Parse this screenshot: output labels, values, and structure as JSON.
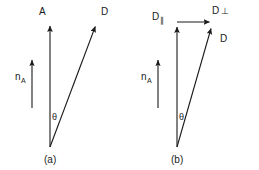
{
  "figure": {
    "background_color": "#ffffff",
    "stroke_color": "#1a1a1a",
    "panels": [
      {
        "id": "a",
        "caption": "(a)",
        "vectors": [
          {
            "name": "A",
            "label": "A",
            "label_symbol": "A",
            "from": [
              50,
              147
            ],
            "to": [
              50,
              22
            ],
            "arrowhead": true
          },
          {
            "name": "D",
            "label": "D",
            "label_symbol": "D",
            "from": [
              50,
              147
            ],
            "to": [
              97,
              22
            ],
            "arrowhead": true
          },
          {
            "name": "n_A",
            "label_symbol": "n",
            "label_subscript": "A",
            "from": [
              32,
              108
            ],
            "to": [
              32,
              56
            ],
            "arrowhead": true
          }
        ],
        "angle": {
          "name": "theta",
          "symbol": "θ",
          "between": [
            "A",
            "D"
          ]
        }
      },
      {
        "id": "b",
        "caption": "(b)",
        "vectors": [
          {
            "name": "D_parallel",
            "label_symbol": "D",
            "label_subscript": "∥",
            "from": [
              177,
              147
            ],
            "to": [
              177,
              24
            ],
            "arrowhead": true
          },
          {
            "name": "D_perpendicular",
            "label_symbol": "D",
            "label_subscript": "⊥",
            "from": [
              177,
              22
            ],
            "to": [
              212,
              22
            ],
            "arrowhead": true
          },
          {
            "name": "D",
            "label_symbol": "D",
            "from": [
              177,
              147
            ],
            "to": [
              213,
              25
            ],
            "arrowhead": true
          },
          {
            "name": "n_A",
            "label_symbol": "n",
            "label_subscript": "A",
            "from": [
              158,
              108
            ],
            "to": [
              158,
              56
            ],
            "arrowhead": true
          }
        ],
        "angle": {
          "name": "theta",
          "symbol": "θ",
          "between": [
            "D_parallel",
            "D"
          ]
        }
      }
    ]
  },
  "labels": {
    "panel_a": {
      "A": "A",
      "D": "D",
      "n": "n",
      "n_sub": "A",
      "theta": "θ",
      "caption": "(a)"
    },
    "panel_b": {
      "D_par": "D",
      "D_par_sub": "∥",
      "D_perp": "D",
      "D_perp_sub": "⊥",
      "D": "D",
      "n": "n",
      "n_sub": "A",
      "theta": "θ",
      "caption": "(b)"
    }
  }
}
